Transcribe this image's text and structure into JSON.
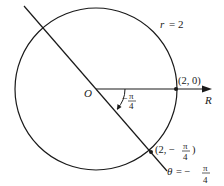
{
  "diagram": {
    "circle_label": "r = 2",
    "circle_label_r": "r",
    "circle_label_eq": "= 2",
    "origin_label": "O",
    "ray_label": "R",
    "point_on_axis": "(2, 0)",
    "angle_label": {
      "sign": "−",
      "numerator": "π",
      "denominator": "4"
    },
    "point_on_line": {
      "prefix": "(2, −",
      "numerator": "π",
      "denominator": "4",
      "suffix": ")"
    },
    "line_label": {
      "lhs": "θ",
      "eq": "= −",
      "numerator": "π",
      "denominator": "4"
    },
    "colors": {
      "stroke": "#1a1a1a",
      "background": "#ffffff"
    }
  }
}
